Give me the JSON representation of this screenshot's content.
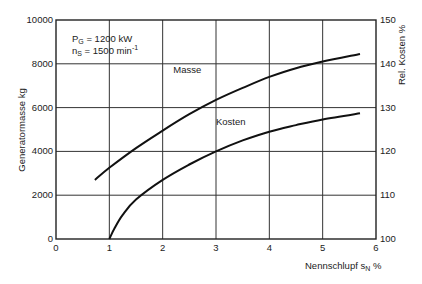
{
  "chart_data": {
    "type": "line",
    "title": "",
    "annotation": {
      "line1_main": "P",
      "line1_sub": "G",
      "line1_rest": " = 1200  kW",
      "line2_main": "n",
      "line2_sub": "S",
      "line2_rest": " = 1500  min",
      "line2_sup": "-1"
    },
    "xlabel": "Nennschlupf  s",
    "xlabel_sub": "N",
    "xlabel_unit": "  %",
    "ylabel_left": "Generatormasse  kg",
    "ylabel_right": "Rel. Kosten  %",
    "xlim": [
      0,
      6
    ],
    "ylim_left": [
      0,
      10000
    ],
    "ylim_right": [
      100,
      150
    ],
    "x_ticks": [
      "0",
      "1",
      "2",
      "3",
      "4",
      "5",
      "6"
    ],
    "y_left_ticks": [
      "0",
      "2000",
      "4000",
      "6000",
      "8000",
      "10000"
    ],
    "y_right_ticks": [
      "100",
      "110",
      "120",
      "130",
      "140",
      "150"
    ],
    "grid": true,
    "series": [
      {
        "name": "Masse",
        "axis": "left",
        "x": [
          0.73,
          1.0,
          1.5,
          2.0,
          2.5,
          3.0,
          3.5,
          4.0,
          4.5,
          5.0,
          5.7
        ],
        "values": [
          2700,
          3250,
          4150,
          4950,
          5700,
          6350,
          6900,
          7400,
          7800,
          8100,
          8450
        ]
      },
      {
        "name": "Kosten",
        "axis": "right",
        "x": [
          1.0,
          1.1,
          1.25,
          1.5,
          2.0,
          2.5,
          3.0,
          3.5,
          4.0,
          4.5,
          5.0,
          5.7
        ],
        "values": [
          100,
          102.5,
          105.5,
          109,
          113.5,
          117,
          120,
          122.5,
          124.5,
          126,
          127.3,
          128.7
        ]
      }
    ],
    "curve_labels": [
      {
        "text": "Masse",
        "x": 2.2,
        "y_left": 7600
      },
      {
        "text": "Kosten",
        "x": 3.0,
        "y_left": 5200
      }
    ]
  }
}
